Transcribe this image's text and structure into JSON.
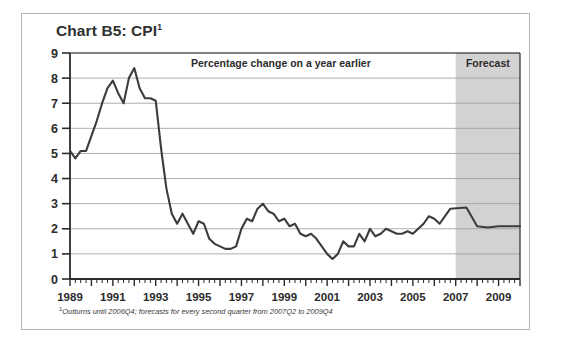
{
  "title": {
    "text": "Chart B5: CPI",
    "footnote_marker": "1"
  },
  "annotations": {
    "series_note": "Percentage change on a year earlier",
    "forecast_label": "Forecast"
  },
  "footnote": {
    "marker": "1",
    "text": "Outturns until 2006Q4; forecasts for every second quarter from 2007Q2 to 2009Q4"
  },
  "colors": {
    "line": "#3c3c3c",
    "forecast_band": "#d2d2d2",
    "gridline": "#9a9a9a",
    "axis": "#2b2b2b",
    "frame": "#b4b4b4",
    "title_text": "#2f2f2f",
    "background": "#ffffff"
  },
  "chart_data": {
    "type": "line",
    "title": "Chart B5: CPI",
    "subtitle": "Percentage change on a year earlier",
    "xlabel": "",
    "ylabel": "",
    "xlim": [
      1989.0,
      2010.0
    ],
    "ylim": [
      0,
      9
    ],
    "ytick_values": [
      0,
      1,
      2,
      3,
      4,
      5,
      6,
      7,
      8,
      9
    ],
    "ytick_labels": [
      "0",
      "1",
      "2",
      "3",
      "4",
      "5",
      "6",
      "7",
      "8",
      "9"
    ],
    "xtick_labels": [
      "1989",
      "1991",
      "1993",
      "1995",
      "1997",
      "1999",
      "2001",
      "2003",
      "2005",
      "2007",
      "2009"
    ],
    "xtick_values": [
      1989,
      1991,
      1993,
      1995,
      1997,
      1999,
      2001,
      2003,
      2005,
      2007,
      2009
    ],
    "minor_tick_interval_years": 0.25,
    "grid": "horizontal",
    "legend": "none",
    "forecast_band": {
      "start": 2007.0,
      "end": 2010.0,
      "label": "Forecast"
    },
    "series": [
      {
        "name": "CPI",
        "x": [
          1989.0,
          1989.25,
          1989.5,
          1989.75,
          1990.0,
          1990.25,
          1990.5,
          1990.75,
          1991.0,
          1991.25,
          1991.5,
          1991.75,
          1992.0,
          1992.25,
          1992.5,
          1992.75,
          1993.0,
          1993.25,
          1993.5,
          1993.75,
          1994.0,
          1994.25,
          1994.5,
          1994.75,
          1995.0,
          1995.25,
          1995.5,
          1995.75,
          1996.0,
          1996.25,
          1996.5,
          1996.75,
          1997.0,
          1997.25,
          1997.5,
          1997.75,
          1998.0,
          1998.25,
          1998.5,
          1998.75,
          1999.0,
          1999.25,
          1999.5,
          1999.75,
          2000.0,
          2000.25,
          2000.5,
          2000.75,
          2001.0,
          2001.25,
          2001.5,
          2001.75,
          2002.0,
          2002.25,
          2002.5,
          2002.75,
          2003.0,
          2003.25,
          2003.5,
          2003.75,
          2004.0,
          2004.25,
          2004.5,
          2004.75,
          2005.0,
          2005.25,
          2005.5,
          2005.75,
          2006.0,
          2006.25,
          2006.5,
          2006.75,
          2007.5,
          2008.0,
          2008.5,
          2009.0,
          2009.5,
          2010.0
        ],
        "values": [
          5.1,
          4.8,
          5.1,
          5.1,
          5.7,
          6.3,
          7.0,
          7.6,
          7.9,
          7.4,
          7.0,
          8.0,
          8.4,
          7.6,
          7.2,
          7.2,
          7.1,
          5.2,
          3.6,
          2.6,
          2.2,
          2.6,
          2.2,
          1.8,
          2.3,
          2.2,
          1.6,
          1.4,
          1.3,
          1.2,
          1.2,
          1.3,
          2.0,
          2.4,
          2.3,
          2.8,
          3.0,
          2.7,
          2.6,
          2.3,
          2.4,
          2.1,
          2.2,
          1.8,
          1.7,
          1.8,
          1.6,
          1.3,
          1.0,
          0.8,
          1.0,
          1.5,
          1.3,
          1.3,
          1.8,
          1.5,
          2.0,
          1.7,
          1.8,
          2.0,
          1.9,
          1.8,
          1.8,
          1.9,
          1.8,
          2.0,
          2.2,
          2.5,
          2.4,
          2.2,
          2.5,
          2.8,
          2.85,
          2.1,
          2.05,
          2.1,
          2.1,
          2.1
        ]
      }
    ]
  }
}
